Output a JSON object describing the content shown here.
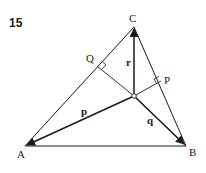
{
  "figure": {
    "number": "15",
    "colors": {
      "line": "#1a1a1a",
      "background": "#ffffff"
    },
    "points": {
      "A": {
        "label": "A",
        "x": 25,
        "y": 146
      },
      "B": {
        "label": "B",
        "x": 186,
        "y": 146
      },
      "C": {
        "label": "C",
        "x": 134,
        "y": 27
      },
      "O": {
        "label": "",
        "x": 134,
        "y": 96
      },
      "Q": {
        "label": "Q",
        "x": 97,
        "y": 66
      },
      "P": {
        "label": "P",
        "x": 161,
        "y": 81
      }
    },
    "vectors": {
      "p": {
        "label": "p",
        "from": "O",
        "to": "A"
      },
      "q": {
        "label": "q",
        "from": "O",
        "to": "B"
      },
      "r": {
        "label": "r",
        "from": "O",
        "to": "C"
      }
    },
    "right_angles": [
      "Q",
      "P"
    ]
  }
}
